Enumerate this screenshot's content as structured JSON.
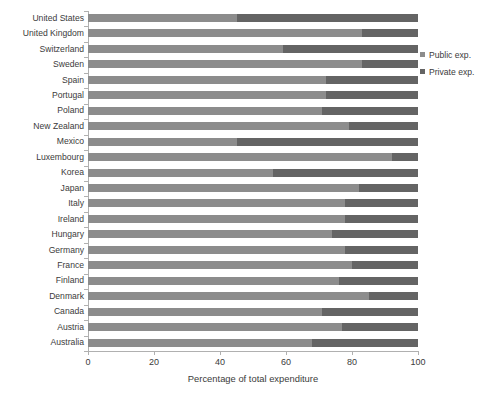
{
  "chart_data": {
    "type": "bar",
    "orientation": "horizontal",
    "stacked": true,
    "title": "",
    "xlabel": "Percentage of total expenditure",
    "ylabel": "",
    "xlim": [
      0,
      100
    ],
    "xticks": [
      0,
      20,
      40,
      60,
      80,
      100
    ],
    "grid": false,
    "legend_position": "right",
    "categories": [
      "United States",
      "United Kingdom",
      "Switzerland",
      "Sweden",
      "Spain",
      "Portugal",
      "Poland",
      "New Zealand",
      "Mexico",
      "Luxembourg",
      "Korea",
      "Japan",
      "Italy",
      "Ireland",
      "Hungary",
      "Germany",
      "France",
      "Finland",
      "Denmark",
      "Canada",
      "Austria",
      "Australia"
    ],
    "series": [
      {
        "name": "Public exp.",
        "color": "#8c8c8c",
        "values": [
          45,
          83,
          59,
          83,
          72,
          72,
          71,
          79,
          45,
          92,
          56,
          82,
          78,
          78,
          74,
          78,
          80,
          76,
          85,
          71,
          77,
          68
        ]
      },
      {
        "name": "Private exp.",
        "color": "#646464",
        "values": [
          55,
          17,
          41,
          17,
          28,
          28,
          29,
          21,
          55,
          8,
          44,
          18,
          22,
          22,
          26,
          22,
          20,
          24,
          15,
          29,
          23,
          32
        ]
      }
    ]
  },
  "legend": {
    "items": [
      {
        "label": "Public exp."
      },
      {
        "label": "Private exp."
      }
    ]
  },
  "axis": {
    "x_title": "Percentage of total expenditure",
    "x_tick_labels": [
      "0",
      "20",
      "40",
      "60",
      "80",
      "100"
    ]
  }
}
